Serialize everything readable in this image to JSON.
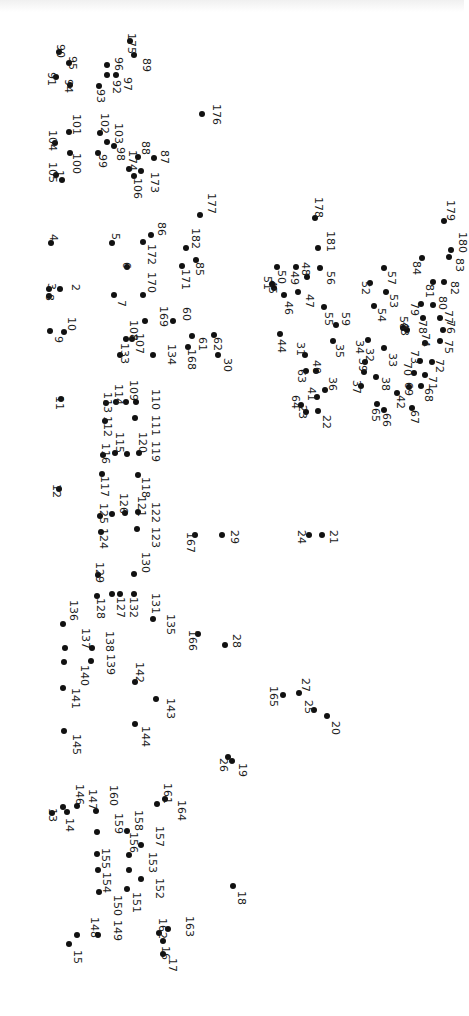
{
  "puzzle": {
    "title": "",
    "orientation": "rotated 90deg clockwise",
    "dot_color": "#111111",
    "background": "#ffffff",
    "points": [
      {
        "n": 1,
        "x": 62,
        "y": 180,
        "lx": 54,
        "ly": 170
      },
      {
        "n": 2,
        "x": 60,
        "y": 289,
        "lx": 70,
        "ly": 284
      },
      {
        "n": 3,
        "x": 49,
        "y": 289,
        "lx": 46,
        "ly": 283
      },
      {
        "n": 4,
        "x": 51,
        "y": 243,
        "lx": 48,
        "ly": 234
      },
      {
        "n": 5,
        "x": 112,
        "y": 243,
        "lx": 110,
        "ly": 233
      },
      {
        "n": 6,
        "x": 127,
        "y": 267,
        "lx": 121,
        "ly": 262
      },
      {
        "n": 7,
        "x": 114,
        "y": 295,
        "lx": 116,
        "ly": 300
      },
      {
        "n": 8,
        "x": 49,
        "y": 296,
        "lx": 44,
        "ly": 294
      },
      {
        "n": 9,
        "x": 50,
        "y": 331,
        "lx": 53,
        "ly": 336
      },
      {
        "n": 10,
        "x": 64,
        "y": 332,
        "lx": 66,
        "ly": 317
      },
      {
        "n": 11,
        "x": 61,
        "y": 399,
        "lx": 54,
        "ly": 396
      },
      {
        "n": 12,
        "x": 59,
        "y": 489,
        "lx": 51,
        "ly": 484
      },
      {
        "n": 13,
        "x": 52,
        "y": 813,
        "lx": 47,
        "ly": 808
      },
      {
        "n": 14,
        "x": 67,
        "y": 812,
        "lx": 64,
        "ly": 818
      },
      {
        "n": 15,
        "x": 69,
        "y": 944,
        "lx": 72,
        "ly": 950
      },
      {
        "n": 16,
        "x": 163,
        "y": 941,
        "lx": 160,
        "ly": 946
      },
      {
        "n": 17,
        "x": 163,
        "y": 954,
        "lx": 167,
        "ly": 958
      },
      {
        "n": 18,
        "x": 233,
        "y": 886,
        "lx": 236,
        "ly": 891
      },
      {
        "n": 19,
        "x": 232,
        "y": 761,
        "lx": 237,
        "ly": 763
      },
      {
        "n": 20,
        "x": 327,
        "y": 716,
        "lx": 330,
        "ly": 721
      },
      {
        "n": 21,
        "x": 322,
        "y": 535,
        "lx": 328,
        "ly": 530
      },
      {
        "n": 22,
        "x": 318,
        "y": 411,
        "lx": 321,
        "ly": 415
      },
      {
        "n": 23,
        "x": 306,
        "y": 412,
        "lx": 297,
        "ly": 405
      },
      {
        "n": 24,
        "x": 309,
        "y": 535,
        "lx": 296,
        "ly": 530
      },
      {
        "n": 25,
        "x": 314,
        "y": 710,
        "lx": 303,
        "ly": 700
      },
      {
        "n": 26,
        "x": 228,
        "y": 757,
        "lx": 218,
        "ly": 758
      },
      {
        "n": 27,
        "x": 299,
        "y": 693,
        "lx": 300,
        "ly": 678
      },
      {
        "n": 28,
        "x": 225,
        "y": 645,
        "lx": 231,
        "ly": 634
      },
      {
        "n": 29,
        "x": 222,
        "y": 535,
        "lx": 229,
        "ly": 530
      },
      {
        "n": 30,
        "x": 218,
        "y": 355,
        "lx": 222,
        "ly": 358
      },
      {
        "n": 31,
        "x": 305,
        "y": 355,
        "lx": 295,
        "ly": 342
      },
      {
        "n": 32,
        "x": 365,
        "y": 362,
        "lx": 364,
        "ly": 348
      },
      {
        "n": 33,
        "x": 384,
        "y": 348,
        "lx": 387,
        "ly": 353
      },
      {
        "n": 34,
        "x": 368,
        "y": 340,
        "lx": 354,
        "ly": 340
      },
      {
        "n": 35,
        "x": 333,
        "y": 341,
        "lx": 334,
        "ly": 344
      },
      {
        "n": 36,
        "x": 325,
        "y": 390,
        "lx": 327,
        "ly": 377
      },
      {
        "n": 37,
        "x": 361,
        "y": 386,
        "lx": 351,
        "ly": 380
      },
      {
        "n": 38,
        "x": 376,
        "y": 377,
        "lx": 380,
        "ly": 377
      },
      {
        "n": 39,
        "x": 364,
        "y": 372,
        "lx": 357,
        "ly": 358
      },
      {
        "n": 40,
        "x": 316,
        "y": 371,
        "lx": 311,
        "ly": 360
      },
      {
        "n": 41,
        "x": 317,
        "y": 397,
        "lx": 306,
        "ly": 387
      },
      {
        "n": 42,
        "x": 397,
        "y": 393,
        "lx": 395,
        "ly": 395
      },
      {
        "n": 43,
        "x": 407,
        "y": 330,
        "lx": 399,
        "ly": 322
      },
      {
        "n": 44,
        "x": 280,
        "y": 334,
        "lx": 276,
        "ly": 339
      },
      {
        "n": 45,
        "x": 274,
        "y": 288,
        "lx": 267,
        "ly": 280
      },
      {
        "n": 46,
        "x": 284,
        "y": 295,
        "lx": 283,
        "ly": 301
      },
      {
        "n": 47,
        "x": 298,
        "y": 292,
        "lx": 304,
        "ly": 294
      },
      {
        "n": 48,
        "x": 307,
        "y": 277,
        "lx": 300,
        "ly": 262
      },
      {
        "n": 49,
        "x": 296,
        "y": 267,
        "lx": 289,
        "ly": 271
      },
      {
        "n": 50,
        "x": 277,
        "y": 267,
        "lx": 276,
        "ly": 270
      },
      {
        "n": 51,
        "x": 272,
        "y": 284,
        "lx": 262,
        "ly": 276
      },
      {
        "n": 52,
        "x": 370,
        "y": 283,
        "lx": 360,
        "ly": 281
      },
      {
        "n": 53,
        "x": 386,
        "y": 292,
        "lx": 388,
        "ly": 294
      },
      {
        "n": 54,
        "x": 374,
        "y": 306,
        "lx": 376,
        "ly": 308
      },
      {
        "n": 55,
        "x": 324,
        "y": 307,
        "lx": 323,
        "ly": 312
      },
      {
        "n": 56,
        "x": 320,
        "y": 268,
        "lx": 325,
        "ly": 271
      },
      {
        "n": 57,
        "x": 384,
        "y": 268,
        "lx": 386,
        "ly": 271
      },
      {
        "n": 58,
        "x": 403,
        "y": 328,
        "lx": 398,
        "ly": 316
      },
      {
        "n": 59,
        "x": 336,
        "y": 325,
        "lx": 340,
        "ly": 312
      },
      {
        "n": 60,
        "x": 173,
        "y": 321,
        "lx": 181,
        "ly": 307
      },
      {
        "n": 61,
        "x": 192,
        "y": 336,
        "lx": 197,
        "ly": 337
      },
      {
        "n": 62,
        "x": 214,
        "y": 335,
        "lx": 212,
        "ly": 337
      },
      {
        "n": 63,
        "x": 306,
        "y": 371,
        "lx": 296,
        "ly": 369
      },
      {
        "n": 64,
        "x": 301,
        "y": 405,
        "lx": 290,
        "ly": 395
      },
      {
        "n": 65,
        "x": 377,
        "y": 404,
        "lx": 370,
        "ly": 408
      },
      {
        "n": 66,
        "x": 384,
        "y": 410,
        "lx": 381,
        "ly": 413
      },
      {
        "n": 67,
        "x": 412,
        "y": 408,
        "lx": 409,
        "ly": 410
      },
      {
        "n": 68,
        "x": 421,
        "y": 386,
        "lx": 423,
        "ly": 388
      },
      {
        "n": 69,
        "x": 409,
        "y": 387,
        "lx": 403,
        "ly": 382
      },
      {
        "n": 70,
        "x": 414,
        "y": 373,
        "lx": 402,
        "ly": 362
      },
      {
        "n": 71,
        "x": 425,
        "y": 375,
        "lx": 427,
        "ly": 376
      },
      {
        "n": 72,
        "x": 432,
        "y": 362,
        "lx": 434,
        "ly": 359
      },
      {
        "n": 73,
        "x": 420,
        "y": 361,
        "lx": 409,
        "ly": 350
      },
      {
        "n": 74,
        "x": 425,
        "y": 343,
        "lx": 420,
        "ly": 333
      },
      {
        "n": 75,
        "x": 440,
        "y": 341,
        "lx": 443,
        "ly": 340
      },
      {
        "n": 76,
        "x": 443,
        "y": 330,
        "lx": 445,
        "ly": 320
      },
      {
        "n": 77,
        "x": 440,
        "y": 318,
        "lx": 443,
        "ly": 310
      },
      {
        "n": 78,
        "x": 423,
        "y": 318,
        "lx": 417,
        "ly": 320
      },
      {
        "n": 79,
        "x": 421,
        "y": 304,
        "lx": 409,
        "ly": 302
      },
      {
        "n": 80,
        "x": 433,
        "y": 305,
        "lx": 437,
        "ly": 296
      },
      {
        "n": 81,
        "x": 433,
        "y": 282,
        "lx": 424,
        "ly": 284
      },
      {
        "n": 82,
        "x": 444,
        "y": 282,
        "lx": 449,
        "ly": 281
      },
      {
        "n": 83,
        "x": 449,
        "y": 257,
        "lx": 454,
        "ly": 258
      },
      {
        "n": 84,
        "x": 422,
        "y": 258,
        "lx": 411,
        "ly": 261
      },
      {
        "n": 85,
        "x": 196,
        "y": 260,
        "lx": 194,
        "ly": 262
      },
      {
        "n": 86,
        "x": 151,
        "y": 235,
        "lx": 156,
        "ly": 222
      },
      {
        "n": 87,
        "x": 154,
        "y": 158,
        "lx": 159,
        "ly": 150
      },
      {
        "n": 88,
        "x": 138,
        "y": 157,
        "lx": 140,
        "ly": 141
      },
      {
        "n": 89,
        "x": 134,
        "y": 55,
        "lx": 141,
        "ly": 58
      },
      {
        "n": 90,
        "x": 59,
        "y": 52,
        "lx": 55,
        "ly": 44
      },
      {
        "n": 91,
        "x": 56,
        "y": 77,
        "lx": 46,
        "ly": 72
      },
      {
        "n": 92,
        "x": 107,
        "y": 75,
        "lx": 111,
        "ly": 80
      },
      {
        "n": 93,
        "x": 99,
        "y": 86,
        "lx": 95,
        "ly": 89
      },
      {
        "n": 94,
        "x": 70,
        "y": 85,
        "lx": 63,
        "ly": 79
      },
      {
        "n": 95,
        "x": 69,
        "y": 63,
        "lx": 67,
        "ly": 56
      },
      {
        "n": 96,
        "x": 107,
        "y": 65,
        "lx": 113,
        "ly": 57
      },
      {
        "n": 97,
        "x": 116,
        "y": 75,
        "lx": 122,
        "ly": 77
      },
      {
        "n": 98,
        "x": 114,
        "y": 146,
        "lx": 115,
        "ly": 147
      },
      {
        "n": 99,
        "x": 98,
        "y": 153,
        "lx": 97,
        "ly": 154
      },
      {
        "n": 100,
        "x": 70,
        "y": 153,
        "lx": 71,
        "ly": 153
      },
      {
        "n": 101,
        "x": 69,
        "y": 132,
        "lx": 71,
        "ly": 114
      },
      {
        "n": 102,
        "x": 100,
        "y": 133,
        "lx": 99,
        "ly": 113
      },
      {
        "n": 103,
        "x": 107,
        "y": 142,
        "lx": 113,
        "ly": 123
      },
      {
        "n": 104,
        "x": 55,
        "y": 143,
        "lx": 47,
        "ly": 130
      },
      {
        "n": 105,
        "x": 56,
        "y": 175,
        "lx": 47,
        "ly": 162
      },
      {
        "n": 106,
        "x": 134,
        "y": 176,
        "lx": 132,
        "ly": 178
      },
      {
        "n": 107,
        "x": 132,
        "y": 339,
        "lx": 134,
        "ly": 333
      },
      {
        "n": 108,
        "x": 126,
        "y": 339,
        "lx": 128,
        "ly": 320
      },
      {
        "n": 109,
        "x": 126,
        "y": 402,
        "lx": 128,
        "ly": 380
      },
      {
        "n": 110,
        "x": 136,
        "y": 402,
        "lx": 150,
        "ly": 389
      },
      {
        "n": 111,
        "x": 135,
        "y": 418,
        "lx": 150,
        "ly": 415
      },
      {
        "n": 112,
        "x": 105,
        "y": 421,
        "lx": 102,
        "ly": 416
      },
      {
        "n": 113,
        "x": 106,
        "y": 403,
        "lx": 102,
        "ly": 392
      },
      {
        "n": 114,
        "x": 116,
        "y": 402,
        "lx": 113,
        "ly": 384
      },
      {
        "n": 115,
        "x": 115,
        "y": 453,
        "lx": 114,
        "ly": 432
      },
      {
        "n": 116,
        "x": 103,
        "y": 455,
        "lx": 100,
        "ly": 443
      },
      {
        "n": 117,
        "x": 102,
        "y": 474,
        "lx": 99,
        "ly": 476
      },
      {
        "n": 118,
        "x": 138,
        "y": 475,
        "lx": 140,
        "ly": 477
      },
      {
        "n": 119,
        "x": 139,
        "y": 453,
        "lx": 150,
        "ly": 441
      },
      {
        "n": 120,
        "x": 127,
        "y": 454,
        "lx": 137,
        "ly": 432
      },
      {
        "n": 121,
        "x": 125,
        "y": 513,
        "lx": 136,
        "ly": 496
      },
      {
        "n": 122,
        "x": 138,
        "y": 512,
        "lx": 150,
        "ly": 502
      },
      {
        "n": 123,
        "x": 137,
        "y": 529,
        "lx": 150,
        "ly": 527
      },
      {
        "n": 124,
        "x": 101,
        "y": 532,
        "lx": 98,
        "ly": 528
      },
      {
        "n": 125,
        "x": 100,
        "y": 516,
        "lx": 98,
        "ly": 503
      },
      {
        "n": 126,
        "x": 112,
        "y": 514,
        "lx": 118,
        "ly": 493
      },
      {
        "n": 127,
        "x": 112,
        "y": 594,
        "lx": 115,
        "ly": 597
      },
      {
        "n": 128,
        "x": 97,
        "y": 596,
        "lx": 95,
        "ly": 598
      },
      {
        "n": 129,
        "x": 98,
        "y": 575,
        "lx": 94,
        "ly": 562
      },
      {
        "n": 130,
        "x": 134,
        "y": 574,
        "lx": 140,
        "ly": 552
      },
      {
        "n": 131,
        "x": 134,
        "y": 594,
        "lx": 150,
        "ly": 593
      },
      {
        "n": 132,
        "x": 120,
        "y": 594,
        "lx": 128,
        "ly": 597
      },
      {
        "n": 133,
        "x": 120,
        "y": 355,
        "lx": 119,
        "ly": 343
      },
      {
        "n": 134,
        "x": 153,
        "y": 355,
        "lx": 166,
        "ly": 344
      },
      {
        "n": 135,
        "x": 153,
        "y": 619,
        "lx": 165,
        "ly": 614
      },
      {
        "n": 136,
        "x": 63,
        "y": 624,
        "lx": 68,
        "ly": 600
      },
      {
        "n": 137,
        "x": 65,
        "y": 648,
        "lx": 80,
        "ly": 628
      },
      {
        "n": 138,
        "x": 92,
        "y": 648,
        "lx": 104,
        "ly": 631
      },
      {
        "n": 139,
        "x": 91,
        "y": 661,
        "lx": 105,
        "ly": 654
      },
      {
        "n": 140,
        "x": 64,
        "y": 662,
        "lx": 79,
        "ly": 665
      },
      {
        "n": 141,
        "x": 63,
        "y": 688,
        "lx": 70,
        "ly": 688
      },
      {
        "n": 142,
        "x": 135,
        "y": 682,
        "lx": 134,
        "ly": 662
      },
      {
        "n": 143,
        "x": 156,
        "y": 699,
        "lx": 165,
        "ly": 698
      },
      {
        "n": 144,
        "x": 135,
        "y": 724,
        "lx": 140,
        "ly": 726
      },
      {
        "n": 145,
        "x": 64,
        "y": 731,
        "lx": 71,
        "ly": 734
      },
      {
        "n": 146,
        "x": 63,
        "y": 807,
        "lx": 74,
        "ly": 784
      },
      {
        "n": 147,
        "x": 77,
        "y": 806,
        "lx": 87,
        "ly": 789
      },
      {
        "n": 148,
        "x": 77,
        "y": 935,
        "lx": 89,
        "ly": 917
      },
      {
        "n": 149,
        "x": 98,
        "y": 935,
        "lx": 112,
        "ly": 920
      },
      {
        "n": 150,
        "x": 99,
        "y": 892,
        "lx": 112,
        "ly": 895
      },
      {
        "n": 151,
        "x": 127,
        "y": 889,
        "lx": 131,
        "ly": 892
      },
      {
        "n": 152,
        "x": 141,
        "y": 879,
        "lx": 154,
        "ly": 878
      },
      {
        "n": 153,
        "x": 129,
        "y": 870,
        "lx": 147,
        "ly": 852
      },
      {
        "n": 154,
        "x": 98,
        "y": 870,
        "lx": 101,
        "ly": 872
      },
      {
        "n": 155,
        "x": 97,
        "y": 854,
        "lx": 100,
        "ly": 848
      },
      {
        "n": 156,
        "x": 129,
        "y": 855,
        "lx": 128,
        "ly": 832
      },
      {
        "n": 157,
        "x": 141,
        "y": 845,
        "lx": 154,
        "ly": 826
      },
      {
        "n": 158,
        "x": 127,
        "y": 831,
        "lx": 133,
        "ly": 810
      },
      {
        "n": 159,
        "x": 97,
        "y": 832,
        "lx": 113,
        "ly": 813
      },
      {
        "n": 160,
        "x": 96,
        "y": 811,
        "lx": 108,
        "ly": 785
      },
      {
        "n": 161,
        "x": 157,
        "y": 804,
        "lx": 162,
        "ly": 783
      },
      {
        "n": 162,
        "x": 159,
        "y": 933,
        "lx": 157,
        "ly": 918
      },
      {
        "n": 163,
        "x": 168,
        "y": 929,
        "lx": 184,
        "ly": 916
      },
      {
        "n": 164,
        "x": 165,
        "y": 799,
        "lx": 176,
        "ly": 800
      },
      {
        "n": 165,
        "x": 283,
        "y": 695,
        "lx": 268,
        "ly": 686
      },
      {
        "n": 166,
        "x": 198,
        "y": 634,
        "lx": 187,
        "ly": 630
      },
      {
        "n": 167,
        "x": 195,
        "y": 535,
        "lx": 185,
        "ly": 532
      },
      {
        "n": 168,
        "x": 188,
        "y": 347,
        "lx": 186,
        "ly": 349
      },
      {
        "n": 169,
        "x": 145,
        "y": 321,
        "lx": 158,
        "ly": 306
      },
      {
        "n": 170,
        "x": 143,
        "y": 295,
        "lx": 146,
        "ly": 272
      },
      {
        "n": 171,
        "x": 182,
        "y": 266,
        "lx": 180,
        "ly": 269
      },
      {
        "n": 172,
        "x": 143,
        "y": 242,
        "lx": 146,
        "ly": 244
      },
      {
        "n": 173,
        "x": 141,
        "y": 171,
        "lx": 149,
        "ly": 172
      },
      {
        "n": 174,
        "x": 129,
        "y": 169,
        "lx": 127,
        "ly": 150
      },
      {
        "n": 175,
        "x": 130,
        "y": 41,
        "lx": 126,
        "ly": 33
      },
      {
        "n": 176,
        "x": 202,
        "y": 114,
        "lx": 211,
        "ly": 104
      },
      {
        "n": 177,
        "x": 200,
        "y": 215,
        "lx": 206,
        "ly": 193
      },
      {
        "n": 178,
        "x": 315,
        "y": 218,
        "lx": 313,
        "ly": 197
      },
      {
        "n": 179,
        "x": 444,
        "y": 221,
        "lx": 445,
        "ly": 200
      },
      {
        "n": 180,
        "x": 451,
        "y": 250,
        "lx": 457,
        "ly": 232
      },
      {
        "n": 181,
        "x": 318,
        "y": 248,
        "lx": 325,
        "ly": 231
      },
      {
        "n": 182,
        "x": 186,
        "y": 248,
        "lx": 190,
        "ly": 228
      }
    ]
  }
}
